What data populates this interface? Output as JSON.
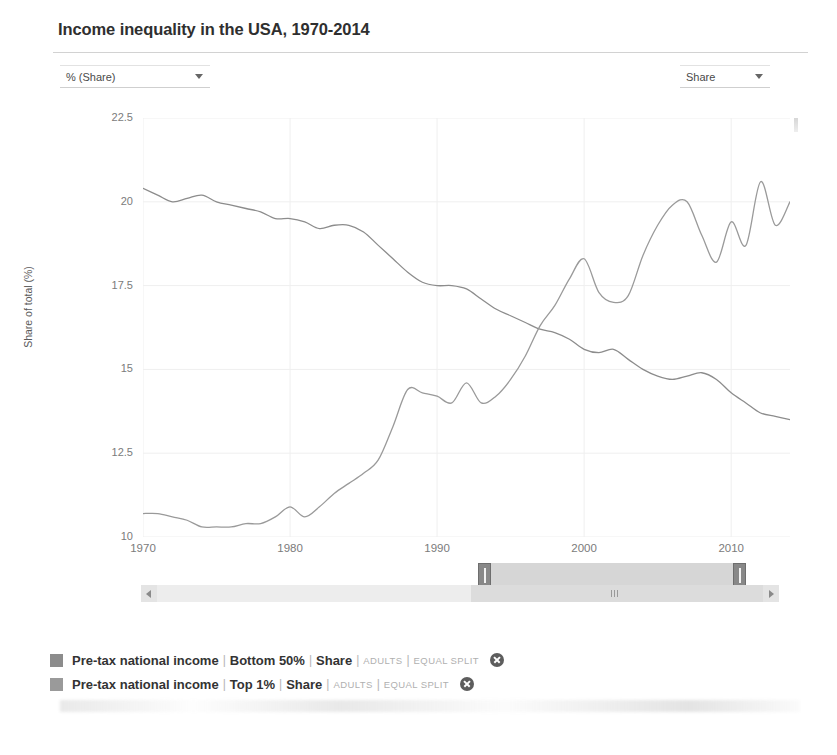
{
  "header": {
    "title": "Income inequality in the USA, 1970-2014"
  },
  "controls": {
    "unit_select": {
      "value": "% (Share)",
      "caret": "chevron-down-icon"
    },
    "metric_select": {
      "value": "Share",
      "caret": "chevron-down-icon"
    }
  },
  "legend": {
    "items": [
      {
        "source": "Pre-tax national income",
        "population": "Bottom 50%",
        "measure": "Share",
        "tag1": "ADULTS",
        "tag2": "EQUAL SPLIT",
        "color": "#8c8c8c",
        "separator": "|",
        "close": "close-icon"
      },
      {
        "source": "Pre-tax national income",
        "population": "Top 1%",
        "measure": "Share",
        "tag1": "ADULTS",
        "tag2": "EQUAL SPLIT",
        "color": "#9a9a9a",
        "separator": "|",
        "close": "close-icon"
      }
    ]
  },
  "scroll": {
    "left_arrow": "arrow-left-icon",
    "right_arrow": "arrow-right-icon",
    "grip": "grip-icon"
  },
  "chart_data": {
    "type": "line",
    "title": "Income inequality in the USA, 1970-2014",
    "xlabel": "",
    "ylabel": "Share of total (%)",
    "xlim": [
      1970,
      2014
    ],
    "ylim": [
      10,
      22.5
    ],
    "xticks": [
      1970,
      1980,
      1990,
      2000,
      2010
    ],
    "yticks": [
      10,
      12.5,
      15,
      17.5,
      20,
      22.5
    ],
    "grid": true,
    "legend_position": "below",
    "x": [
      1970,
      1971,
      1972,
      1973,
      1974,
      1975,
      1976,
      1977,
      1978,
      1979,
      1980,
      1981,
      1982,
      1983,
      1984,
      1985,
      1986,
      1987,
      1988,
      1989,
      1990,
      1991,
      1992,
      1993,
      1994,
      1995,
      1996,
      1997,
      1998,
      1999,
      2000,
      2001,
      2002,
      2003,
      2004,
      2005,
      2006,
      2007,
      2008,
      2009,
      2010,
      2011,
      2012,
      2013,
      2014
    ],
    "series": [
      {
        "name": "Pre-tax national income | Bottom 50% | Share",
        "color": "#8c8c8c",
        "values": [
          20.4,
          20.2,
          20.0,
          20.1,
          20.2,
          20.0,
          19.9,
          19.8,
          19.7,
          19.5,
          19.5,
          19.4,
          19.2,
          19.3,
          19.3,
          19.1,
          18.7,
          18.3,
          17.9,
          17.6,
          17.5,
          17.5,
          17.4,
          17.1,
          16.8,
          16.6,
          16.4,
          16.2,
          16.1,
          15.9,
          15.6,
          15.5,
          15.6,
          15.3,
          15.0,
          14.8,
          14.7,
          14.8,
          14.9,
          14.7,
          14.3,
          14.0,
          13.7,
          13.6,
          13.5
        ],
        "values_note": "approximate readings; series declines from ~20.4% in 1970 to ~12.5% in 2014",
        "endpoints": {
          "1970": 20.4,
          "2014": 12.5
        }
      },
      {
        "name": "Pre-tax national income | Top 1% | Share",
        "color": "#9a9a9a",
        "values": [
          10.7,
          10.7,
          10.6,
          10.5,
          10.3,
          10.3,
          10.3,
          10.4,
          10.4,
          10.6,
          10.9,
          10.6,
          10.9,
          11.3,
          11.6,
          11.9,
          12.3,
          13.3,
          14.4,
          14.3,
          14.2,
          14.0,
          14.6,
          14.0,
          14.2,
          14.7,
          15.4,
          16.3,
          16.9,
          17.7,
          18.3,
          17.3,
          17.0,
          17.2,
          18.4,
          19.3,
          19.9,
          20.0,
          19.0,
          18.2,
          19.4,
          18.7,
          20.6,
          19.3,
          20.0
        ],
        "values_note": "approximate readings; series rises from ~10.7% in 1970 to ~20.0% in 2014",
        "endpoints": {
          "1970": 10.7,
          "2014": 20.0
        }
      }
    ]
  }
}
